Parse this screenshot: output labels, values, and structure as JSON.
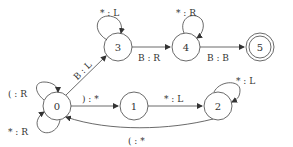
{
  "diagram": {
    "type": "turing-machine-state-diagram",
    "states": [
      {
        "id": "0",
        "label": "0",
        "accepting": false
      },
      {
        "id": "1",
        "label": "1",
        "accepting": false
      },
      {
        "id": "2",
        "label": "2",
        "accepting": false
      },
      {
        "id": "3",
        "label": "3",
        "accepting": false
      },
      {
        "id": "4",
        "label": "4",
        "accepting": false
      },
      {
        "id": "5",
        "label": "5",
        "accepting": true
      }
    ],
    "transitions": [
      {
        "from": "0",
        "to": "0",
        "label": "( : R"
      },
      {
        "from": "0",
        "to": "0",
        "label": "* : R"
      },
      {
        "from": "0",
        "to": "1",
        "label": ") : *"
      },
      {
        "from": "1",
        "to": "2",
        "label": "* : L"
      },
      {
        "from": "2",
        "to": "2",
        "label": "* : L"
      },
      {
        "from": "2",
        "to": "0",
        "label": "( : *"
      },
      {
        "from": "0",
        "to": "3",
        "label": "B : L"
      },
      {
        "from": "3",
        "to": "3",
        "label": "* : L"
      },
      {
        "from": "3",
        "to": "4",
        "label": "B : R"
      },
      {
        "from": "4",
        "to": "4",
        "label": "* : R"
      },
      {
        "from": "4",
        "to": "5",
        "label": "B : B"
      }
    ]
  }
}
